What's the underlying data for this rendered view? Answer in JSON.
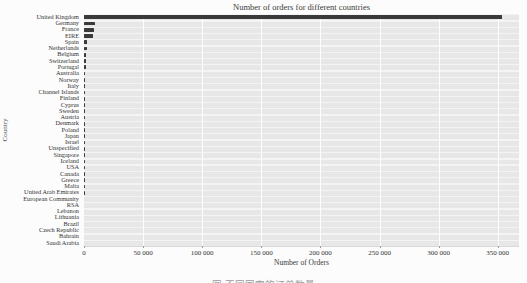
{
  "title": "Number of orders for different countries",
  "axes": {
    "x_label": "Number of Orders",
    "y_label": "Country"
  },
  "caption_partial": "图 不同国家的订单数量",
  "x_ticks": [
    {
      "value": 0,
      "label": "0"
    },
    {
      "value": 50000,
      "label": "50 000"
    },
    {
      "value": 100000,
      "label": "100 000"
    },
    {
      "value": 150000,
      "label": "150 000"
    },
    {
      "value": 200000,
      "label": "200 000"
    },
    {
      "value": 250000,
      "label": "250 000"
    },
    {
      "value": 300000,
      "label": "300 000"
    },
    {
      "value": 350000,
      "label": "350 000"
    }
  ],
  "colors": {
    "bar": "#3a3a3a",
    "plot_background": "#e8e8e8",
    "gridline": "#ffffff"
  },
  "chart_data": {
    "type": "bar",
    "orientation": "horizontal",
    "title": "Number of orders for different countries",
    "xlabel": "Number of Orders",
    "ylabel": "Country",
    "xlim": [
      0,
      368000
    ],
    "grid": true,
    "legend": false,
    "categories": [
      "United Kingdom",
      "Germany",
      "France",
      "EIRE",
      "Spain",
      "Netherlands",
      "Belgium",
      "Switzerland",
      "Portugal",
      "Australia",
      "Norway",
      "Italy",
      "Channel Islands",
      "Finland",
      "Cyprus",
      "Sweden",
      "Austria",
      "Denmark",
      "Poland",
      "Japan",
      "Israel",
      "Unspecified",
      "Singapore",
      "Iceland",
      "USA",
      "Canada",
      "Greece",
      "Malta",
      "United Arab Emirates",
      "European Community",
      "RSA",
      "Lebanon",
      "Lithuania",
      "Brazil",
      "Czech Republic",
      "Bahrain",
      "Saudi Arabia"
    ],
    "values": [
      354000,
      9000,
      8500,
      7250,
      2550,
      2400,
      2050,
      1900,
      1500,
      1250,
      1100,
      800,
      750,
      690,
      610,
      460,
      400,
      380,
      340,
      325,
      300,
      280,
      230,
      185,
      180,
      150,
      145,
      125,
      68,
      61,
      58,
      45,
      35,
      32,
      30,
      19,
      10
    ]
  }
}
